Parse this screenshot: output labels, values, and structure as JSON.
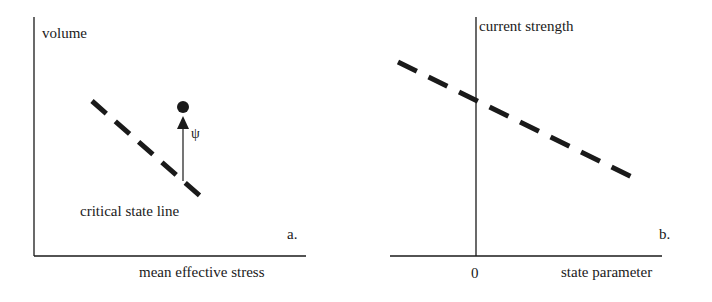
{
  "panels": [
    {
      "id": "a",
      "panel_label": "a.",
      "y_axis_label": "volume",
      "x_axis_label": "mean effective stress",
      "line_label": "critical state line",
      "symbol_label": "ψ"
    },
    {
      "id": "b",
      "panel_label": "b.",
      "y_axis_label": "current strength",
      "x_axis_label": "state parameter",
      "x_origin_tick": "0"
    }
  ],
  "colors": {
    "ink": "#1a1a1a",
    "background": "#ffffff"
  }
}
